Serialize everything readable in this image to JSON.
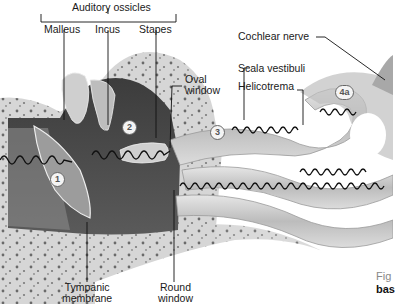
{
  "diagram": {
    "group_label": "Auditory ossicles",
    "labels": {
      "malleus": "Malleus",
      "incus": "Incus",
      "stapes": "Stapes",
      "oval_window_1": "Oval",
      "oval_window_2": "window",
      "scala_vestibuli": "Scala vestibuli",
      "helicotrema": "Helicotrema",
      "cochlear_nerve": "Cochlear nerve",
      "tympanic_1": "Tympanic",
      "tympanic_2": "membrane",
      "round_1": "Round",
      "round_2": "window"
    },
    "step_markers": [
      "1",
      "2",
      "3",
      "4a"
    ],
    "caption": {
      "line1": "Fig",
      "line2": "bas"
    },
    "colors": {
      "bone": "#d9d9d9",
      "bone_spots": "#6e6e6e",
      "cavity": "#4a4a4a",
      "duct": "#c8c8c8",
      "wave": "#111111",
      "leader": "#111111"
    }
  }
}
